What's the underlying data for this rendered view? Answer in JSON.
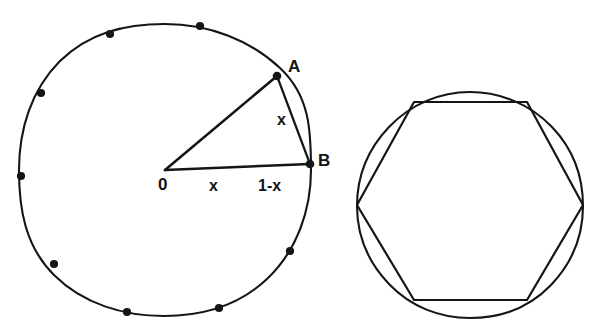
{
  "figure": {
    "background_color": "#ffffff",
    "ink_color": "#151515",
    "labels": {
      "point_a": "A",
      "point_b": "B",
      "chord_ab": "x",
      "origin": "0",
      "radius_segment": "x",
      "outer_segment": "1-x"
    },
    "left_diagram": {
      "name": "circle-with-inscribed-points",
      "center": {
        "x": 165,
        "y": 170
      },
      "radius": 146,
      "marked_points_count": 10,
      "marked_points": [
        {
          "label": "A",
          "x": 277,
          "y": 76
        },
        {
          "label": "B",
          "x": 310,
          "y": 164
        },
        {
          "label": "",
          "x": 290,
          "y": 251
        },
        {
          "label": "",
          "x": 219,
          "y": 308
        },
        {
          "label": "",
          "x": 127,
          "y": 312
        },
        {
          "label": "",
          "x": 54,
          "y": 264
        },
        {
          "label": "",
          "x": 21,
          "y": 176
        },
        {
          "label": "",
          "x": 41,
          "y": 93
        },
        {
          "label": "",
          "x": 110,
          "y": 34
        },
        {
          "label": "",
          "x": 200,
          "y": 26
        }
      ],
      "segments": [
        {
          "name": "radius-oa",
          "from": "O",
          "to": "A"
        },
        {
          "name": "radius-ob",
          "from": "O",
          "to": "B"
        },
        {
          "name": "chord-ab",
          "from": "A",
          "to": "B",
          "label": "x"
        }
      ]
    },
    "right_diagram": {
      "name": "hexagon-inscribed-in-circle",
      "center": {
        "x": 470,
        "y": 205
      },
      "circle_radius": 113,
      "hexagon_sides": 6,
      "hexagon_orientation": "flat-top",
      "hexagon_vertices": [
        {
          "x": 583,
          "y": 205
        },
        {
          "x": 527,
          "y": 102
        },
        {
          "x": 414,
          "y": 102
        },
        {
          "x": 357,
          "y": 205
        },
        {
          "x": 414,
          "y": 300
        },
        {
          "x": 527,
          "y": 300
        }
      ]
    }
  }
}
